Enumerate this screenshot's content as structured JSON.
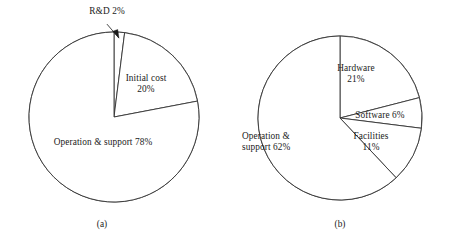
{
  "figure": {
    "background_color": "#ffffff",
    "line_color": "#333333",
    "text_color": "#1a1a1a"
  },
  "panels": [
    {
      "caption": "(a)",
      "center": {
        "x": 114,
        "y": 117
      },
      "radius": 85
    },
    {
      "caption": "(b)",
      "center": {
        "x": 112,
        "y": 118
      },
      "radius": 82
    }
  ],
  "labels": {
    "a_rnd": "R&D  2%",
    "a_initial_name": "Initial cost",
    "a_initial_pct": "20%",
    "a_ops": "Operation & support 78%",
    "b_hardware_name": "Hardware",
    "b_hardware_pct": "21%",
    "b_software": "Software 6%",
    "b_facilities_name": "Facilities",
    "b_facilities_pct": "11%",
    "b_ops_name": "Operation &",
    "b_ops_pct": "support 62%"
  },
  "chart_data": [
    {
      "type": "pie",
      "title": "(a)",
      "categories": [
        "R&D",
        "Initial cost",
        "Operation & support"
      ],
      "values": [
        2,
        20,
        78
      ],
      "unit": "%",
      "start_angle_deg": 0,
      "direction": "clockwise",
      "annotations": [
        {
          "text": "R&D  2%",
          "target": "R&D",
          "style": "leader-line-with-arrow"
        },
        {
          "text": "Initial cost 20%",
          "target": "Initial cost",
          "style": "inside"
        },
        {
          "text": "Operation & support 78%",
          "target": "Operation & support",
          "style": "inside"
        }
      ],
      "legend": "none",
      "grid": false,
      "fill": "none",
      "stroke": "#333333"
    },
    {
      "type": "pie",
      "title": "(b)",
      "categories": [
        "Hardware",
        "Software",
        "Facilities",
        "Operation & support"
      ],
      "values": [
        21,
        6,
        11,
        62
      ],
      "unit": "%",
      "start_angle_deg": 0,
      "direction": "clockwise",
      "annotations": [
        {
          "text": "Hardware 21%",
          "target": "Hardware",
          "style": "inside"
        },
        {
          "text": "Software 6%",
          "target": "Software",
          "style": "inside"
        },
        {
          "text": "Facilities 11%",
          "target": "Facilities",
          "style": "inside"
        },
        {
          "text": "Operation & support 62%",
          "target": "Operation & support",
          "style": "inside"
        }
      ],
      "legend": "none",
      "grid": false,
      "fill": "none",
      "stroke": "#333333"
    }
  ]
}
